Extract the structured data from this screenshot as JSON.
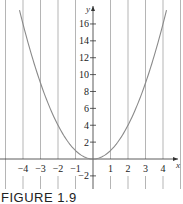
{
  "figure": {
    "caption": "FIGURE 1.9"
  },
  "chart_data": {
    "type": "line",
    "title": "",
    "function": "y = x^2",
    "xlabel": "x",
    "ylabel": "y",
    "xlim": [
      -5,
      5
    ],
    "ylim": [
      -3,
      17
    ],
    "x_ticks": [
      -4,
      -3,
      -2,
      -1,
      1,
      2,
      3,
      4
    ],
    "x_tick_labels": [
      "−4",
      "−3",
      "−2",
      "−1",
      "1",
      "2",
      "3",
      "4"
    ],
    "y_ticks": [
      -2,
      2,
      4,
      6,
      8,
      10,
      12,
      14,
      16
    ],
    "y_tick_labels": [
      "−2",
      "2",
      "4",
      "6",
      "8",
      "10",
      "12",
      "14",
      "16"
    ],
    "grid": {
      "vertical": true,
      "horizontal": false,
      "vertical_at": [
        -5,
        -4,
        -3,
        -2,
        -1,
        1,
        2,
        3,
        4,
        5
      ]
    },
    "series": [
      {
        "name": "y = x^2",
        "x": [
          -4.2,
          -4,
          -3,
          -2,
          -1,
          0,
          1,
          2,
          3,
          4,
          4.2
        ],
        "values": [
          17.64,
          16,
          9,
          4,
          1,
          0,
          1,
          4,
          9,
          16,
          17.64
        ]
      }
    ],
    "colors": {
      "curve": "#8a8a8a",
      "grid": "#b5b5b5",
      "axis": "#333333"
    }
  }
}
